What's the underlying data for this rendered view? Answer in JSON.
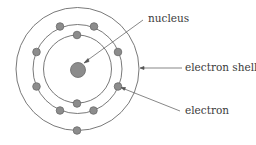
{
  "diagram": {
    "type": "atom-shell-model",
    "nucleus": {
      "cx": 78,
      "cy": 70,
      "r": 8,
      "color": "#8c8c8c"
    },
    "shells": [
      {
        "r": 34,
        "electrons": [
          [
            77,
            35
          ],
          [
            77,
            104
          ]
        ]
      },
      {
        "r": 45,
        "electrons": [
          [
            60,
            26
          ],
          [
            94,
            26
          ],
          [
            37,
            52
          ],
          [
            118,
            52
          ],
          [
            37,
            87
          ],
          [
            118,
            86
          ],
          [
            60,
            111
          ],
          [
            93,
            111
          ]
        ]
      },
      {
        "r": 62,
        "electrons": [
          [
            77,
            131
          ]
        ]
      }
    ],
    "electron_color": "#8c8c8c",
    "line_color": "#555555",
    "labels": {
      "nucleus": "nucleus",
      "electron_shell": "electron shell",
      "electron": "electron"
    }
  }
}
